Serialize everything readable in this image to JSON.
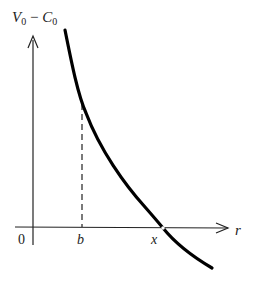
{
  "diagram": {
    "y_axis_label_main": "V",
    "y_axis_label_sub1": "0",
    "y_axis_label_minus": " − ",
    "y_axis_label_c": "C",
    "y_axis_label_sub2": "0",
    "x_axis_label": "r",
    "origin_label": "0",
    "tick_b_label": "b",
    "tick_x_label": "x",
    "colors": {
      "curve": "#000000",
      "axes": "#222222",
      "dashed": "#333333",
      "background": "#ffffff"
    }
  }
}
